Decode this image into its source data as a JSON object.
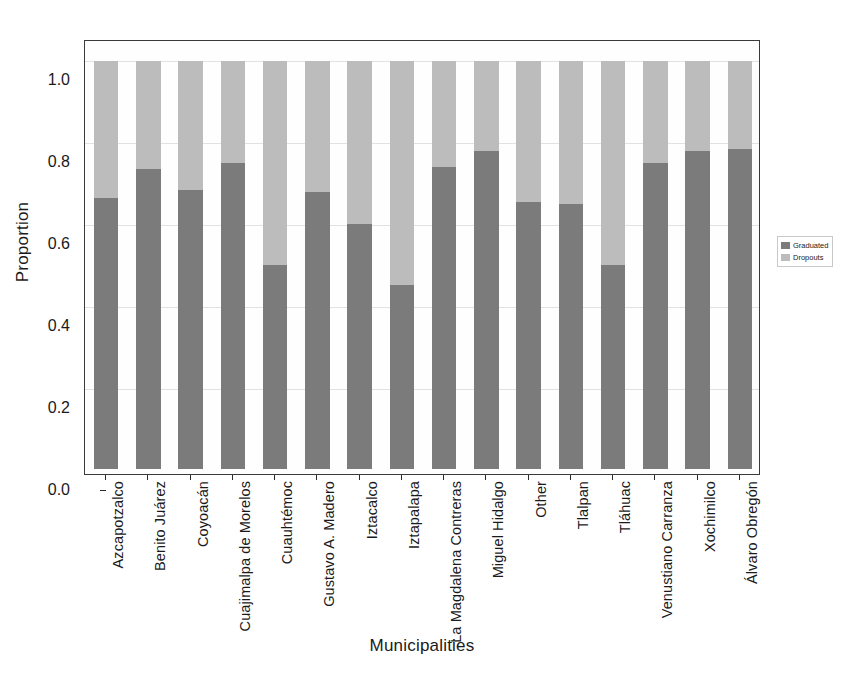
{
  "chart_data": {
    "type": "bar",
    "subtype": "stacked-100-percent",
    "title": "",
    "xlabel": "Municipalities",
    "ylabel": "Proportion",
    "ylim": [
      0.0,
      1.0
    ],
    "yticks": [
      "0.0",
      "0.2",
      "0.4",
      "0.6",
      "0.8",
      "1.0"
    ],
    "ytick_values": [
      0.0,
      0.2,
      0.4,
      0.6,
      0.8,
      1.0
    ],
    "grid": true,
    "legend_position": "right",
    "categories": [
      "Azcapotzalco",
      "Benito Juárez",
      "Coyoacán",
      "Cuajimalpa de Morelos",
      "Cuauhtémoc",
      "Gustavo A. Madero",
      "Iztacalco",
      "Iztapalapa",
      "La Magdalena Contreras",
      "Miguel Hidalgo",
      "Other",
      "Tlalpan",
      "Tláhuac",
      "Venustiano Carranza",
      "Xochimilco",
      "Álvaro Obregón"
    ],
    "series": [
      {
        "name": "Graduated",
        "color": "#7b7b7b",
        "values": [
          0.665,
          0.735,
          0.685,
          0.75,
          0.5,
          0.68,
          0.6,
          0.45,
          0.74,
          0.78,
          0.655,
          0.65,
          0.5,
          0.75,
          0.78,
          0.785
        ]
      },
      {
        "name": "Dropouts",
        "color": "#bcbcbc",
        "values": [
          0.335,
          0.265,
          0.315,
          0.25,
          0.5,
          0.32,
          0.4,
          0.55,
          0.26,
          0.22,
          0.345,
          0.35,
          0.5,
          0.25,
          0.22,
          0.215
        ]
      }
    ]
  },
  "legend": {
    "entries": [
      {
        "label": "Graduated",
        "color": "#7b7b7b"
      },
      {
        "label": "Dropouts",
        "color": "#bcbcbc"
      }
    ]
  },
  "axes": {
    "y_title": "Proportion",
    "x_title": "Municipalities"
  }
}
